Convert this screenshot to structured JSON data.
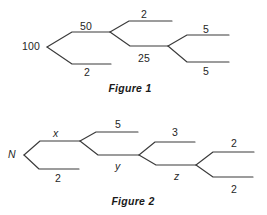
{
  "canvas": {
    "width": 267,
    "height": 215,
    "background": "#ffffff"
  },
  "style": {
    "stroke": "#3b3b3b",
    "text": "#262626",
    "caption": "#1a1a1a"
  },
  "figures": [
    {
      "id": "figure-1",
      "caption": "Figure 1",
      "caption_pos": {
        "x": 130,
        "y": 92
      },
      "root_label": "100",
      "root_pos": {
        "x": 22,
        "y": 50
      },
      "branches": [
        {
          "name": "branch-root-upper",
          "label": "50",
          "label_pos": {
            "x": 80,
            "y": 30
          },
          "path": "M47,47 L72,32 L110,32"
        },
        {
          "name": "branch-root-lower",
          "label": "2",
          "label_pos": {
            "x": 84,
            "y": 76
          },
          "path": "M47,47 L72,64 L111,64"
        },
        {
          "name": "branch-mid-upper",
          "label": "2",
          "label_pos": {
            "x": 141,
            "y": 18
          },
          "path": "M110,32 L129,21 L172,21"
        },
        {
          "name": "branch-mid-lower",
          "label": "25",
          "label_pos": {
            "x": 138,
            "y": 62
          },
          "path": "M110,32 L130,46 L168,46"
        },
        {
          "name": "branch-end-upper",
          "label": "5",
          "label_pos": {
            "x": 203,
            "y": 33
          },
          "path": "M168,46 L187,35 L229,35"
        },
        {
          "name": "branch-end-lower",
          "label": "5",
          "label_pos": {
            "x": 203,
            "y": 75
          },
          "path": "M168,46 L187,62 L229,62"
        }
      ]
    },
    {
      "id": "figure-2",
      "caption": "Figure 2",
      "caption_pos": {
        "x": 133,
        "y": 205
      },
      "root_label": "N",
      "root_pos": {
        "x": 8,
        "y": 158
      },
      "branches": [
        {
          "name": "branch-root-upper",
          "label": "x",
          "italic": true,
          "label_pos": {
            "x": 53,
            "y": 137
          },
          "path": "M24,155 L40,141 L80,141"
        },
        {
          "name": "branch-root-lower",
          "label": "2",
          "italic": false,
          "label_pos": {
            "x": 55,
            "y": 182
          },
          "path": "M24,155 L39,169 L79,169"
        },
        {
          "name": "branch-second-upper",
          "label": "5",
          "italic": false,
          "label_pos": {
            "x": 115,
            "y": 128
          },
          "path": "M80,141 L96,132 L138,132"
        },
        {
          "name": "branch-second-lower",
          "label": "y",
          "italic": true,
          "label_pos": {
            "x": 115,
            "y": 170
          },
          "path": "M80,141 L98,155 L139,155"
        },
        {
          "name": "branch-third-upper",
          "label": "3",
          "italic": false,
          "label_pos": {
            "x": 172,
            "y": 136
          },
          "path": "M139,155 L155,142 L195,142"
        },
        {
          "name": "branch-third-lower",
          "label": "z",
          "italic": true,
          "label_pos": {
            "x": 174,
            "y": 180
          },
          "path": "M139,155 L156,165 L196,165"
        },
        {
          "name": "branch-end-upper",
          "label": "2",
          "italic": false,
          "label_pos": {
            "x": 231,
            "y": 147
          },
          "path": "M196,165 L213,152 L254,152"
        },
        {
          "name": "branch-end-lower",
          "label": "2",
          "italic": false,
          "label_pos": {
            "x": 231,
            "y": 193
          },
          "path": "M196,165 L213,177 L253,177"
        }
      ]
    }
  ]
}
